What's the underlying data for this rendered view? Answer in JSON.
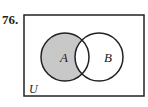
{
  "problem": {
    "number": "76."
  },
  "diagram": {
    "type": "venn",
    "universe_label": "U",
    "sets": [
      {
        "label": "A",
        "shaded": "only"
      },
      {
        "label": "B",
        "shaded": "none"
      }
    ],
    "shaded_region": "A minus B",
    "shade_color": "#c8c8c8",
    "line_color": "#222222"
  }
}
